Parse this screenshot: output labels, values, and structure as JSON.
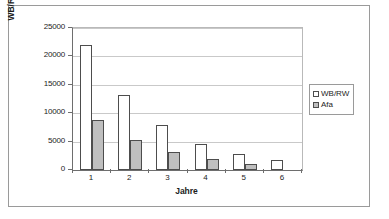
{
  "chart_data": {
    "type": "bar",
    "title": "",
    "xlabel": "Jahre",
    "ylabel": "WB/RW (in €)",
    "categories": [
      "1",
      "2",
      "3",
      "4",
      "5",
      "6"
    ],
    "series": [
      {
        "name": "WB/RW",
        "color": "#ffffff",
        "values": [
          22000,
          13200,
          7900,
          4500,
          2800,
          1700
        ]
      },
      {
        "name": "Afa",
        "color": "#bfbfbf",
        "values": [
          8800,
          5200,
          3100,
          1900,
          1050,
          0
        ]
      }
    ],
    "ylim": [
      0,
      25000
    ],
    "yticks": [
      0,
      5000,
      10000,
      15000,
      20000,
      25000
    ],
    "ytick_labels": [
      "0",
      "5000",
      "10000",
      "15000",
      "20000",
      "25000"
    ],
    "grid": true,
    "legend_position": "right"
  },
  "legend": {
    "items": [
      {
        "label": "WB/RW",
        "marker": "square-open-icon"
      },
      {
        "label": "Afa",
        "marker": "square-filled-icon"
      }
    ]
  }
}
